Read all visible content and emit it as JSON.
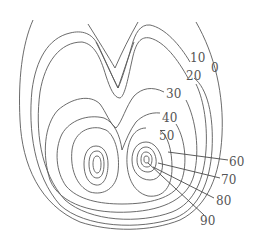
{
  "diagram": {
    "type": "contour map",
    "line_color": "#5a5a5a",
    "label_color": "#555555",
    "contour_values": [
      0,
      10,
      20,
      30,
      40,
      50,
      60,
      70,
      80,
      90
    ],
    "labels": {
      "v0": "0",
      "v10": "10",
      "v20": "20",
      "v30": "30",
      "v40": "40",
      "v50": "50",
      "v60": "60",
      "v70": "70",
      "v80": "80",
      "v90": "90"
    },
    "peaks": [
      {
        "name": "left-peak",
        "center": [
          97,
          163
        ]
      },
      {
        "name": "right-peak",
        "center": [
          146,
          159
        ]
      }
    ]
  }
}
